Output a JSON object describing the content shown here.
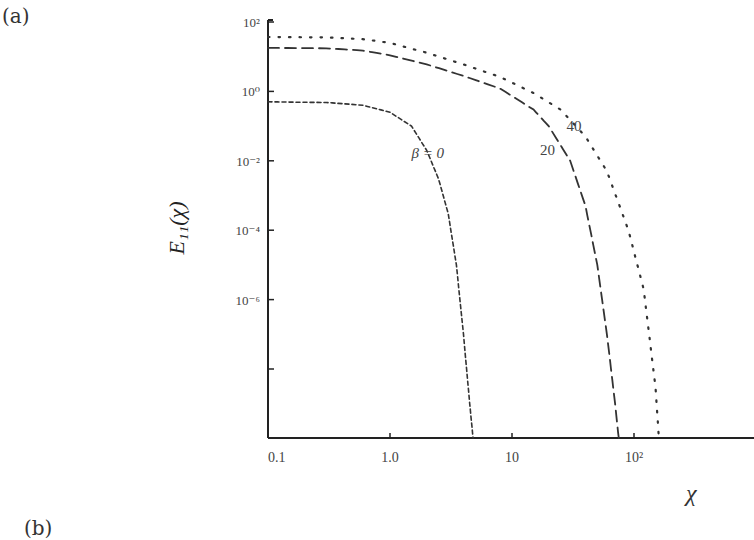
{
  "figure": {
    "panel_label_a": "(a)",
    "panel_label_b": "(b)"
  },
  "chart_data": {
    "type": "line",
    "title": "",
    "xlabel": "χ",
    "ylabel": "E11(χ)",
    "ylabel_display": "E₁₁(χ)",
    "xscale": "log",
    "yscale": "log",
    "xlim": [
      0.1,
      1000
    ],
    "ylim": [
      1e-10,
      100
    ],
    "grid": false,
    "legend_position": "inline annotations",
    "x_ticks": [
      0.1,
      1.0,
      10,
      100
    ],
    "x_tick_labels": [
      "0.1",
      "1.0",
      "10",
      "10²"
    ],
    "y_ticks": [
      100,
      1,
      0.01,
      0.0001,
      1e-06
    ],
    "y_tick_labels": [
      "10²",
      "10⁰",
      "10⁻²",
      "10⁻⁴",
      "10⁻⁶"
    ],
    "series": [
      {
        "name": "β = 0",
        "label": "β = 0",
        "style": "short-dash",
        "x": [
          0.1,
          0.3,
          0.6,
          1.0,
          1.5,
          2.0,
          2.5,
          3.0,
          3.5,
          4.0,
          4.5,
          4.8
        ],
        "y": [
          0.5,
          0.48,
          0.4,
          0.25,
          0.1,
          0.02,
          0.003,
          0.0003,
          1e-05,
          1e-07,
          1e-09,
          1e-10
        ]
      },
      {
        "name": "β = 20",
        "label": "20",
        "style": "long-dash",
        "x": [
          0.1,
          0.3,
          0.6,
          1.0,
          2.0,
          4.0,
          8.0,
          15,
          20,
          30,
          40,
          50,
          60,
          70,
          75
        ],
        "y": [
          18,
          17.5,
          15,
          11,
          6,
          2.8,
          1.2,
          0.3,
          0.1,
          0.01,
          0.0005,
          1e-05,
          1e-07,
          1e-09,
          1e-10
        ]
      },
      {
        "name": "β = 40",
        "label": "40",
        "style": "dotted",
        "x": [
          0.1,
          0.3,
          0.6,
          1.0,
          2.0,
          4.0,
          8.0,
          15,
          25,
          40,
          60,
          90,
          120,
          150,
          160
        ],
        "y": [
          37,
          36,
          32,
          25,
          13,
          6,
          2.6,
          0.9,
          0.3,
          0.05,
          0.005,
          0.0001,
          2e-06,
          3e-09,
          1e-10
        ]
      }
    ],
    "annotations": [
      {
        "text": "β = 0",
        "x": 1.5,
        "y": 0.012
      },
      {
        "text": "20",
        "x": 17,
        "y": 0.015
      },
      {
        "text": "40",
        "x": 28,
        "y": 0.07
      }
    ]
  }
}
